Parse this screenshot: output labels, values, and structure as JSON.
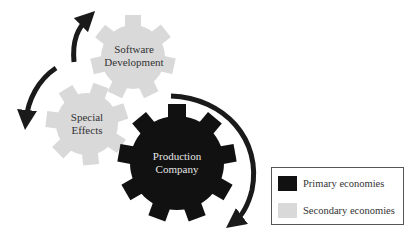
{
  "gears": [
    {
      "id": "software-development",
      "label_line1": "Software",
      "label_line2": "Development",
      "type": "secondary",
      "color": "#d9d9d9"
    },
    {
      "id": "special-effects",
      "label_line1": "Special",
      "label_line2": "Effects",
      "type": "secondary",
      "color": "#d9d9d9"
    },
    {
      "id": "production-company",
      "label_line1": "Production",
      "label_line2": "Company",
      "type": "primary",
      "color": "#111111"
    }
  ],
  "legend": {
    "items": [
      {
        "label": "Primary economies",
        "color": "#111111"
      },
      {
        "label": "Secondary economies",
        "color": "#d9d9d9"
      }
    ]
  },
  "arrows": [
    "arrow-to-software-development",
    "arrow-to-special-effects",
    "arrow-around-production-company"
  ]
}
